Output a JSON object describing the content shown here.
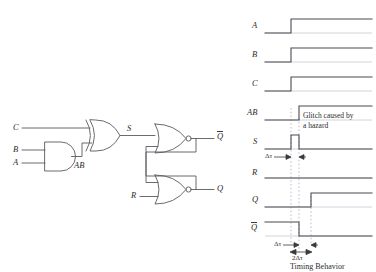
{
  "figure": {
    "caption": "Timing Behavior"
  },
  "circuit": {
    "inputs": [
      {
        "name": "C",
        "label": "C"
      },
      {
        "name": "B",
        "label": "B"
      },
      {
        "name": "A",
        "label": "A"
      },
      {
        "name": "R",
        "label": "R"
      }
    ],
    "internal": [
      {
        "name": "AB",
        "label": "AB"
      },
      {
        "name": "S",
        "label": "S"
      }
    ],
    "outputs": [
      {
        "name": "Qbar",
        "label": "Q",
        "overbar": true
      },
      {
        "name": "Q",
        "label": "Q",
        "overbar": false
      }
    ],
    "gates": [
      {
        "name": "and-gate",
        "type": "AND",
        "inputs": [
          "B",
          "A"
        ],
        "output": "AB"
      },
      {
        "name": "xor-gate",
        "type": "XOR",
        "inputs": [
          "C",
          "AB"
        ],
        "output": "S"
      },
      {
        "name": "nor-gate-top",
        "type": "NOR",
        "inputs": [
          "S",
          "Q"
        ],
        "output": "Qbar"
      },
      {
        "name": "nor-gate-bottom",
        "type": "NOR",
        "inputs": [
          "Qbar",
          "R"
        ],
        "output": "Q"
      }
    ]
  },
  "timing": {
    "annotations": {
      "glitch_line1": "Glitch caused by",
      "glitch_line2": "a hazard",
      "delta_tau": "Δτ",
      "two_delta_tau": "2Δτ"
    },
    "signals": [
      {
        "name": "A",
        "label": "A",
        "overbar": false,
        "transition": "rise",
        "edge_x": 291
      },
      {
        "name": "B",
        "label": "B",
        "overbar": false,
        "transition": "rise",
        "edge_x": 291
      },
      {
        "name": "C",
        "label": "C",
        "overbar": false,
        "transition": "rise",
        "edge_x": 291
      },
      {
        "name": "AB",
        "label": "AB",
        "overbar": false,
        "transition": "rise",
        "edge_x": 299
      },
      {
        "name": "S",
        "label": "S",
        "overbar": false,
        "transition": "glitch-pulse",
        "edge_x": 291,
        "pulse_end_x": 299
      },
      {
        "name": "R",
        "label": "R",
        "overbar": false,
        "transition": "low",
        "edge_x": 0
      },
      {
        "name": "Q",
        "label": "Q",
        "overbar": false,
        "transition": "rise",
        "edge_x": 311
      },
      {
        "name": "Qbar",
        "label": "Q",
        "overbar": true,
        "transition": "fall",
        "edge_x": 299
      }
    ]
  },
  "colors": {
    "wire": "#5a5a60",
    "waveform": "#4a4a52",
    "baseline": "#c9c9cf",
    "dashed": "#b0b0b6",
    "text": "#2b2b2b"
  }
}
